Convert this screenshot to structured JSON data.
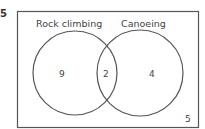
{
  "question_number": "5",
  "diagram": {
    "type": "venn",
    "sets": [
      {
        "label": "Rock climbing",
        "only_count": "9"
      },
      {
        "label": "Canoeing",
        "only_count": "4"
      }
    ],
    "intersection_count": "2",
    "outside_count": "5"
  },
  "colors": {
    "stroke": "#555555",
    "text": "#444444"
  }
}
